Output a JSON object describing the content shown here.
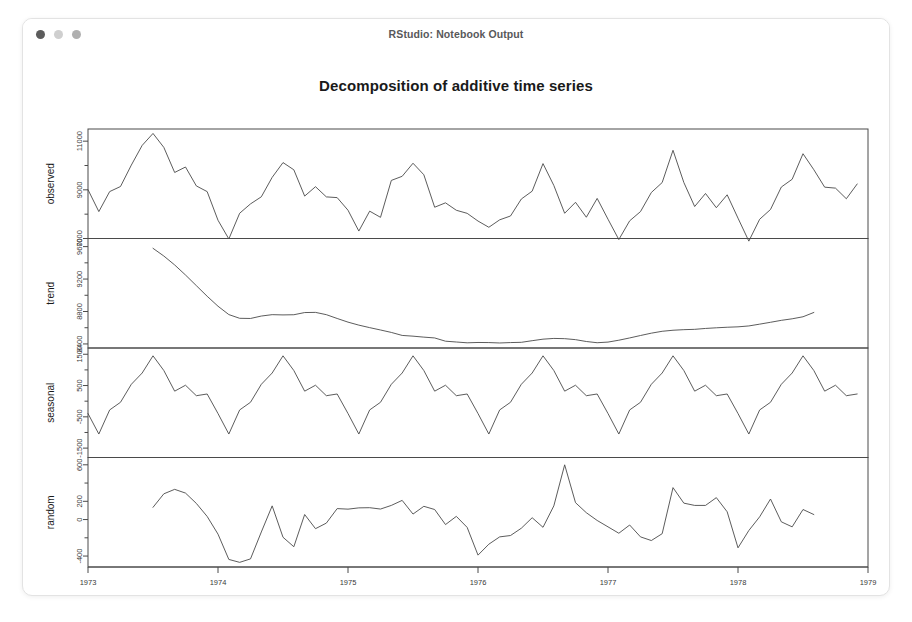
{
  "window": {
    "title": "RStudio: Notebook Output",
    "traffic_lights": [
      {
        "name": "close-dot",
        "color": "#5c5c5c"
      },
      {
        "name": "minimize-dot",
        "color": "#cfcfcf"
      },
      {
        "name": "zoom-dot",
        "color": "#b0b0b0"
      }
    ]
  },
  "chart_data": {
    "type": "line",
    "title": "Decomposition of additive time series",
    "xlabel": "Time",
    "ylabel": "",
    "grid": false,
    "legend": "none",
    "xlim": [
      1973.0,
      1979.0
    ],
    "xticks": [
      1973,
      1974,
      1975,
      1976,
      1977,
      1978,
      1979
    ],
    "xticklabels": [
      "1973",
      "1974",
      "1975",
      "1976",
      "1977",
      "1978",
      "1979"
    ],
    "panels": [
      {
        "name": "observed",
        "label": "observed",
        "ylim": [
          7000,
          11500
        ],
        "yticks": [
          7000,
          9000,
          11000
        ],
        "yticklabels": [
          "7000",
          "9000",
          "11000"
        ],
        "minor_yticks": [
          8000,
          10000
        ],
        "x_start": 1973.0,
        "x_step": 0.08333333,
        "values": [
          9007,
          8106,
          8928,
          9137,
          10017,
          10826,
          11317,
          10744,
          9713,
          9938,
          9161,
          8927,
          7750,
          6981,
          8038,
          8422,
          8714,
          9512,
          10120,
          9823,
          8743,
          9129,
          8710,
          8680,
          8162,
          7306,
          8124,
          7870,
          9387,
          9556,
          10093,
          9620,
          8285,
          8466,
          8160,
          8034,
          7717,
          7461,
          7767,
          7925,
          8623,
          8945,
          10078,
          9179,
          8037,
          8488,
          7874,
          8647,
          7792,
          6957,
          7726,
          8106,
          8890,
          9299,
          10625,
          9302,
          8314,
          8850,
          8265,
          8796,
          7836,
          6892,
          7791,
          8192,
          9115,
          9434,
          10484,
          9827,
          9110,
          9070,
          8633,
          9240
        ]
      },
      {
        "name": "trend",
        "label": "trend",
        "ylim": [
          8350,
          9700
        ],
        "yticks": [
          8400,
          8800,
          9200,
          9600
        ],
        "yticklabels": [
          "8400",
          "8800",
          "9200",
          "9600"
        ],
        "minor_yticks": [
          8600,
          9000,
          9400
        ],
        "x_start": 1973.5,
        "x_step": 0.08333333,
        "values": [
          9579,
          9484,
          9374,
          9250,
          9119,
          8988,
          8865,
          8762,
          8716,
          8714,
          8744,
          8761,
          8758,
          8760,
          8787,
          8789,
          8761,
          8714,
          8669,
          8632,
          8601,
          8572,
          8542,
          8505,
          8496,
          8484,
          8474,
          8434,
          8424,
          8414,
          8418,
          8417,
          8412,
          8417,
          8420,
          8440,
          8459,
          8468,
          8465,
          8453,
          8430,
          8415,
          8423,
          8446,
          8474,
          8504,
          8533,
          8556,
          8569,
          8576,
          8580,
          8591,
          8599,
          8606,
          8611,
          8622,
          8644,
          8667,
          8691,
          8710,
          8735,
          8788
        ]
      },
      {
        "name": "seasonal",
        "label": "seasonal",
        "ylim": [
          -1800,
          1700
        ],
        "yticks": [
          -1500,
          -500,
          500,
          1500
        ],
        "yticklabels": [
          "-1500",
          "-500",
          "500",
          "1500"
        ],
        "minor_yticks": [
          -1000,
          0,
          1000
        ],
        "x_start": 1973.0,
        "x_step": 0.08333333,
        "values": [
          -395,
          -1050,
          -280,
          -35,
          540,
          900,
          1450,
          980,
          320,
          510,
          175,
          230,
          -395,
          -1050,
          -280,
          -35,
          540,
          900,
          1450,
          980,
          320,
          510,
          175,
          230,
          -395,
          -1050,
          -280,
          -35,
          540,
          900,
          1450,
          980,
          320,
          510,
          175,
          230,
          -395,
          -1050,
          -280,
          -35,
          540,
          900,
          1450,
          980,
          320,
          510,
          175,
          230,
          -395,
          -1050,
          -280,
          -35,
          540,
          900,
          1450,
          980,
          320,
          510,
          175,
          230,
          -395,
          -1050,
          -280,
          -35,
          540,
          900,
          1450,
          980,
          320,
          510,
          175,
          230
        ]
      },
      {
        "name": "random",
        "label": "random",
        "ylim": [
          -520,
          680
        ],
        "yticks": [
          -400,
          0,
          200,
          600
        ],
        "yticklabels": [
          "-400",
          "0",
          "200",
          "600"
        ],
        "minor_yticks": [
          -200,
          400
        ],
        "x_start": 1973.5,
        "x_step": 0.08333333,
        "values": [
          134,
          282,
          331,
          290,
          177,
          34,
          -160,
          -437,
          -469,
          -431,
          -136,
          150,
          -194,
          -298,
          55,
          -100,
          -39,
          120,
          114,
          128,
          130,
          115,
          155,
          210,
          60,
          145,
          110,
          -55,
          35,
          -86,
          -390,
          -270,
          -190,
          -175,
          -95,
          20,
          -85,
          150,
          600,
          185,
          75,
          -10,
          -80,
          -150,
          -60,
          -190,
          -230,
          -155,
          350,
          180,
          155,
          155,
          240,
          85,
          -310,
          -120,
          30,
          225,
          -25,
          -80,
          110,
          55
        ]
      }
    ]
  }
}
